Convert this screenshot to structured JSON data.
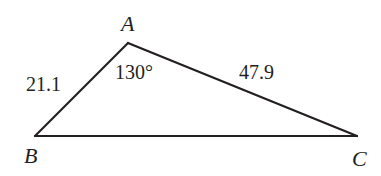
{
  "diagram": {
    "type": "triangle",
    "vertices": {
      "A": {
        "label": "A"
      },
      "B": {
        "label": "B"
      },
      "C": {
        "label": "C"
      }
    },
    "sides": {
      "AB": {
        "label": "21.1",
        "value": 21.1
      },
      "AC": {
        "label": "47.9",
        "value": 47.9
      },
      "BC": {
        "label": ""
      }
    },
    "angles": {
      "A": {
        "label": "130°",
        "value": 130
      }
    }
  }
}
